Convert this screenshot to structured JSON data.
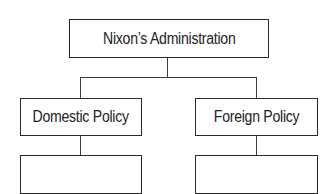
{
  "diagram": {
    "type": "hierarchy",
    "root": {
      "label": "Nixon’s Administration"
    },
    "branches": [
      {
        "label": "Domestic Policy",
        "children": [
          {
            "label": ""
          }
        ]
      },
      {
        "label": "Foreign Policy",
        "children": [
          {
            "label": ""
          }
        ]
      }
    ],
    "colors": {
      "border": "#2a2a2a",
      "connector": "#3a3a3a",
      "background": "#ffffff",
      "text": "#222222"
    }
  }
}
